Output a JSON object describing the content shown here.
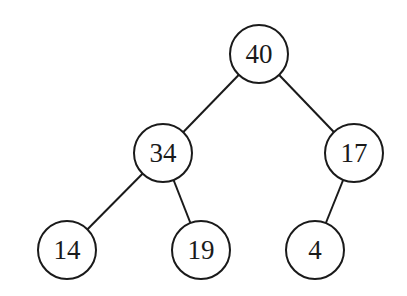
{
  "diagram": {
    "type": "binary-tree",
    "nodes": [
      {
        "id": "n40",
        "label": "40",
        "x": 259,
        "y": 54
      },
      {
        "id": "n34",
        "label": "34",
        "x": 163,
        "y": 153
      },
      {
        "id": "n17",
        "label": "17",
        "x": 354,
        "y": 153
      },
      {
        "id": "n14",
        "label": "14",
        "x": 67,
        "y": 250
      },
      {
        "id": "n19",
        "label": "19",
        "x": 201,
        "y": 250
      },
      {
        "id": "n4",
        "label": "4",
        "x": 315,
        "y": 250
      }
    ],
    "edges": [
      {
        "from": "n40",
        "to": "n34"
      },
      {
        "from": "n40",
        "to": "n17"
      },
      {
        "from": "n34",
        "to": "n14"
      },
      {
        "from": "n34",
        "to": "n19"
      },
      {
        "from": "n17",
        "to": "n4"
      }
    ],
    "node_radius": 29
  }
}
